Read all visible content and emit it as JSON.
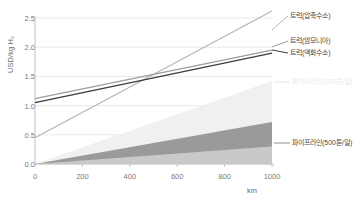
{
  "chart_data": {
    "type": "area",
    "title": "",
    "xlabel": "km",
    "ylabel": "USD/kg H₂",
    "xlim": [
      0,
      1000
    ],
    "ylim": [
      0.0,
      2.5
    ],
    "grid": true,
    "legend_position": "right",
    "x_ticks": [
      "0",
      "200",
      "400",
      "600",
      "800",
      "1000"
    ],
    "x_tick_values": [
      0,
      200,
      400,
      600,
      800,
      1000
    ],
    "y_ticks": [
      "0.0",
      "0.5",
      "1.0",
      "1.5",
      "2.0",
      "2.5"
    ],
    "y_tick_values": [
      0.0,
      0.5,
      1.0,
      1.5,
      2.0,
      2.5
    ],
    "x": [
      0,
      1000
    ],
    "series": [
      {
        "name": "트럭(압축수소)",
        "kind": "line",
        "color": "#b6b6b6",
        "values": [
          0.45,
          2.62
        ],
        "label_x": 290,
        "label_y": 16
      },
      {
        "name": "트럭(암모니아)",
        "kind": "line",
        "color": "#9d9d9d",
        "values": [
          1.12,
          1.95
        ],
        "label_x": 290,
        "label_y": 41
      },
      {
        "name": "트럭(액화수소)",
        "kind": "line",
        "color": "#3c3c3c",
        "values": [
          1.05,
          1.9
        ],
        "label_x": 290,
        "label_y": 53
      },
      {
        "name": "파이프라인(100톤/일)",
        "kind": "area",
        "color": "#f0f0f0",
        "values": [
          0.0,
          1.42
        ],
        "label_x": 292,
        "label_y": 82
      },
      {
        "name": "파이프라인(500톤/일)",
        "kind": "area",
        "color": "#9a9a9a",
        "values": [
          0.0,
          0.72
        ],
        "label_x": 292,
        "label_y": 143
      },
      {
        "name": "",
        "kind": "area",
        "color": "#c9c9c9",
        "values": [
          0.0,
          0.3
        ],
        "label_x": 0,
        "label_y": 0
      }
    ],
    "colors": {
      "grid": "#e9e9e9",
      "axis": "#c2c2c2",
      "tick_text": "#7a7a7a",
      "legend_text_dark": "#4a4a4a",
      "legend_text_faint": "#eaeaea"
    }
  }
}
